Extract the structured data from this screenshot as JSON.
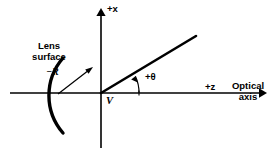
{
  "figure": {
    "background_color": "#ffffff",
    "stroke_color": "#000000"
  },
  "axes": {
    "vertical": {
      "label": "+x",
      "icon": "arrow-up-icon",
      "origin": {
        "x": 101,
        "y": 93
      },
      "tip": {
        "x": 101,
        "y": 10
      },
      "tail": {
        "x": 101,
        "y": 148
      }
    },
    "horizontal": {
      "label": "+z",
      "name_line1": "Optical",
      "name_line2": "axis",
      "icon": "arrow-right-icon",
      "tail": {
        "x": 10,
        "y": 93
      },
      "tip": {
        "x": 265,
        "y": 93
      }
    }
  },
  "vertex": {
    "label": "V",
    "x": 101,
    "y": 93
  },
  "lens_surface": {
    "label_line1": "Lens",
    "label_line2": "surface",
    "arc_center": {
      "x": 158,
      "y": 93
    },
    "arc_radius": 57,
    "arc_top_end": {
      "x": 63,
      "y": 58
    },
    "arc_bottom_end": {
      "x": 63,
      "y": 133
    }
  },
  "radius_annotation": {
    "label": "−R",
    "arrow_from": {
      "x": 58,
      "y": 94
    },
    "arrow_to": {
      "x": 93,
      "y": 67
    }
  },
  "ray": {
    "label": "+θ",
    "angle_degrees": 34,
    "from": {
      "x": 101,
      "y": 93
    },
    "to": {
      "x": 196,
      "y": 36
    },
    "angle_arc_radius": 38
  }
}
